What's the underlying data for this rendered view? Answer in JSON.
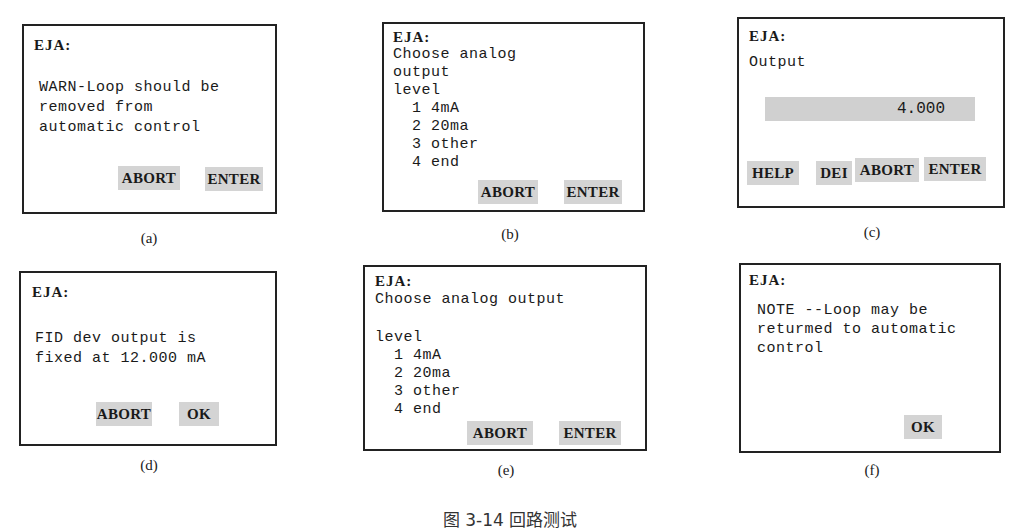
{
  "panels": {
    "a": {
      "title": "EJA:",
      "lines": [
        "WARN-Loop should be",
        "removed from",
        "automatic control"
      ],
      "buttons": [
        "ABORT",
        "ENTER"
      ],
      "label": "(a)"
    },
    "b": {
      "title": "EJA:",
      "lines": [
        "Choose analog",
        "output",
        "level",
        "  1 4mA",
        "  2 20ma",
        "  3 other",
        "  4 end"
      ],
      "buttons": [
        "ABORT",
        "ENTER"
      ],
      "label": "(b)"
    },
    "c": {
      "title": "EJA:",
      "lines": [
        "Output"
      ],
      "field_value": "4.000",
      "buttons": [
        "HELP",
        "DEI",
        "ABORT",
        "ENTER"
      ],
      "label": "(c)"
    },
    "d": {
      "title": "EJA:",
      "lines": [
        "FID dev output is",
        "fixed at 12.000 mA"
      ],
      "buttons": [
        "ABORT",
        "OK"
      ],
      "label": "(d)"
    },
    "e": {
      "title": "EJA:",
      "lines": [
        "Choose analog output",
        "",
        "level",
        "  1 4mA",
        "  2 20ma",
        "  3 other",
        "  4 end"
      ],
      "buttons": [
        "ABORT",
        "ENTER"
      ],
      "label": "(e)"
    },
    "f": {
      "title": "EJA:",
      "lines": [
        "NOTE --Loop may be",
        "returmed to automatic",
        "control"
      ],
      "buttons": [
        "OK"
      ],
      "label": "(f)"
    }
  },
  "caption": "图 3-14  回路测试"
}
